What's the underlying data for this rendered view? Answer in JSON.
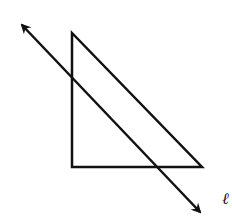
{
  "diagram": {
    "type": "geometry",
    "colors": {
      "stroke": "#111111",
      "background": "#ffffff"
    },
    "triangle": {
      "vertices": [
        [
          72,
          33
        ],
        [
          72,
          167
        ],
        [
          202,
          167
        ]
      ],
      "right_angle_at": "bottom-left"
    },
    "line": {
      "label": "ℓ",
      "from": [
        20,
        23
      ],
      "to": [
        202,
        214
      ],
      "arrows": "both"
    }
  }
}
